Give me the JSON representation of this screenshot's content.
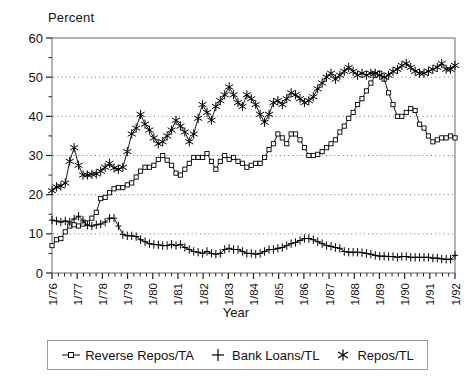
{
  "chart_data": {
    "type": "line",
    "title": "",
    "xlabel": "Year",
    "ylabel": "Percent",
    "ylim": [
      0,
      60
    ],
    "yticks": [
      0,
      10,
      20,
      30,
      40,
      50,
      60
    ],
    "grid": "horizontal-dotted",
    "legend_position": "bottom",
    "x_tick_labels": [
      "1/76",
      "1/77",
      "1/78",
      "1/79",
      "1/80",
      "1/81",
      "1/82",
      "1/83",
      "1/84",
      "1/85",
      "1/86",
      "1/87",
      "1/88",
      "1/89",
      "1/90",
      "1/91",
      "1/92"
    ],
    "x_minor_ticks_per_label": 4,
    "x_start_year": 1976,
    "x_end_year": 1992,
    "points_per_year": 4,
    "series": [
      {
        "name": "Reverse Repos/TA",
        "marker": "square",
        "values": [
          7.0,
          8.5,
          8.8,
          10.5,
          12.0,
          12.3,
          12.0,
          12.5,
          12.8,
          14.0,
          15.5,
          19.0,
          19.3,
          20.5,
          21.5,
          21.8,
          21.8,
          22.5,
          23.0,
          24.5,
          26.0,
          27.0,
          27.0,
          27.5,
          29.0,
          30.0,
          28.8,
          27.5,
          25.5,
          25.0,
          26.5,
          28.0,
          29.5,
          29.5,
          29.5,
          30.5,
          28.5,
          26.5,
          28.5,
          30.0,
          29.0,
          29.5,
          28.5,
          28.0,
          27.0,
          27.5,
          28.0,
          28.0,
          29.5,
          31.5,
          33.0,
          35.5,
          34.5,
          33.0,
          35.5,
          35.5,
          34.0,
          32.0,
          30.0,
          30.0,
          30.3,
          31.0,
          32.0,
          33.0,
          34.0,
          36.0,
          37.5,
          39.5,
          41.0,
          43.0,
          44.5,
          46.5,
          48.5,
          50.5,
          51.0,
          49.5,
          46.0,
          43.0,
          40.0,
          40.0,
          41.0,
          42.0,
          41.5,
          38.0,
          37.0,
          35.0,
          33.5,
          34.0,
          34.5,
          34.5,
          35.0,
          34.5
        ],
        "note": "Lower-to-middle series, open square markers"
      },
      {
        "name": "Bank Loans/TL",
        "marker": "plus",
        "values": [
          13.5,
          13.3,
          13.0,
          13.3,
          13.0,
          13.8,
          14.5,
          13.5,
          12.2,
          12.0,
          12.3,
          12.5,
          13.0,
          14.0,
          14.0,
          12.0,
          9.8,
          9.5,
          9.5,
          9.3,
          8.5,
          8.0,
          7.5,
          7.3,
          7.2,
          7.0,
          7.0,
          7.3,
          7.0,
          7.3,
          6.5,
          6.0,
          5.5,
          5.3,
          5.0,
          5.5,
          5.0,
          4.8,
          5.0,
          6.0,
          6.3,
          6.0,
          6.0,
          5.5,
          5.0,
          5.0,
          4.8,
          5.0,
          5.5,
          6.0,
          6.0,
          6.3,
          6.5,
          7.0,
          7.5,
          7.8,
          8.3,
          8.8,
          8.8,
          8.5,
          8.0,
          7.5,
          7.0,
          6.8,
          6.5,
          6.3,
          5.5,
          5.3,
          5.3,
          5.3,
          5.2,
          5.0,
          4.8,
          4.5,
          4.3,
          4.3,
          4.2,
          4.2,
          4.0,
          4.2,
          4.2,
          4.0,
          4.0,
          4.0,
          4.0,
          4.0,
          3.8,
          3.8,
          3.6,
          3.5,
          3.5,
          4.5
        ],
        "note": "Bottom declining series, plus markers"
      },
      {
        "name": "Repos/TL",
        "marker": "asterisk",
        "values": [
          21.0,
          22.0,
          22.2,
          23.0,
          28.5,
          32.0,
          27.5,
          25.0,
          25.0,
          25.2,
          25.3,
          26.0,
          27.0,
          28.0,
          26.8,
          26.5,
          27.0,
          31.0,
          35.5,
          37.0,
          40.5,
          38.0,
          36.5,
          34.5,
          33.0,
          33.5,
          35.0,
          36.5,
          39.0,
          37.5,
          36.0,
          33.5,
          35.5,
          39.5,
          43.0,
          41.0,
          39.0,
          42.5,
          44.0,
          45.5,
          47.5,
          45.5,
          43.5,
          42.5,
          45.5,
          44.5,
          43.0,
          40.5,
          38.5,
          40.5,
          43.5,
          44.0,
          43.0,
          44.5,
          46.0,
          45.5,
          44.5,
          43.5,
          44.0,
          45.0,
          47.0,
          48.5,
          50.0,
          51.0,
          49.5,
          50.5,
          51.5,
          52.5,
          51.5,
          50.5,
          51.0,
          50.5,
          51.0,
          51.0,
          50.5,
          50.0,
          50.5,
          51.5,
          52.0,
          53.0,
          53.5,
          52.5,
          51.5,
          51.0,
          51.0,
          51.5,
          52.0,
          52.5,
          53.5,
          52.0,
          52.0,
          53.0
        ],
        "note": "Top rising series, asterisk markers"
      }
    ]
  },
  "legend": {
    "items": [
      {
        "label": "Reverse Repos/TA",
        "marker": "square-marker-icon"
      },
      {
        "label": "Bank Loans/TL",
        "marker": "plus-marker-icon"
      },
      {
        "label": "Repos/TL",
        "marker": "asterisk-marker-icon"
      }
    ]
  },
  "colors": {
    "line": "#000000",
    "frame": "#808080",
    "grid": "#707070",
    "background": "#ffffff",
    "text": "#111111"
  }
}
